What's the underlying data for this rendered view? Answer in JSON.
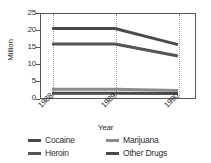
{
  "chart_data": {
    "type": "line",
    "title": "",
    "xlabel": "Year",
    "ylabel": "Million",
    "x": [
      "1988",
      "1989",
      "1990"
    ],
    "categories": [
      "1988",
      "1989",
      "1990"
    ],
    "xlim": [
      1988,
      1990.4
    ],
    "ylim": [
      0,
      25
    ],
    "yticks": [
      0,
      5,
      10,
      15,
      20,
      25
    ],
    "ytick_labels": [
      "0",
      "5",
      "10",
      "15",
      "20",
      "25"
    ],
    "xtick_labels": [
      "1988",
      "1989",
      "1990"
    ],
    "grid": "vertical-dotted",
    "legend_position": "below",
    "series": [
      {
        "name": "Cocaine",
        "values": [
          20.5,
          20.5,
          15.8
        ],
        "color": "#4a4a4a",
        "width": 3
      },
      {
        "name": "Heroin",
        "values": [
          16.0,
          16.0,
          12.5
        ],
        "color": "#555555",
        "width": 3
      },
      {
        "name": "Marijuana",
        "values": [
          2.8,
          2.8,
          2.5
        ],
        "color": "#8c8c8c",
        "width": 3
      },
      {
        "name": "Other Drugs",
        "values": [
          1.7,
          1.7,
          1.6
        ],
        "color": "#4a4a4a",
        "width": 3
      }
    ]
  },
  "axes": {
    "ylabel": "Million",
    "xlabel": "Year",
    "ytick_labels": [
      "25",
      "20",
      "15",
      "10",
      "5",
      "0"
    ],
    "xtick_labels": [
      "1988",
      "1989",
      "1990"
    ]
  },
  "legend": {
    "entries": [
      {
        "label": "Cocaine",
        "color": "#4a4a4a"
      },
      {
        "label": "Marijuana",
        "color": "#8c8c8c"
      },
      {
        "label": "Heroin",
        "color": "#555555"
      },
      {
        "label": "Other Drugs",
        "color": "#4a4a4a"
      }
    ]
  },
  "colors": {
    "frame": "#555555",
    "grid": "#9a9a9a",
    "text": "#2b2b2b",
    "background": "#ffffff"
  }
}
